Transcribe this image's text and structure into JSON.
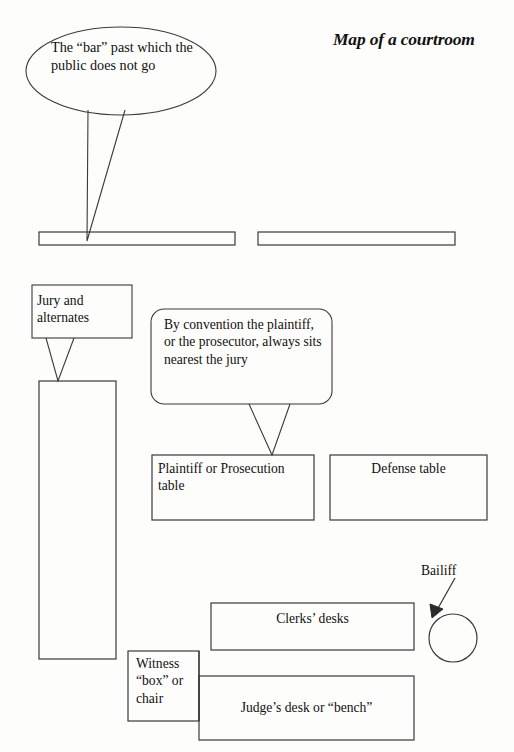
{
  "page": {
    "title": "Map of a courtroom",
    "width": 514,
    "height": 752,
    "background_color": "#fdfdfc",
    "stroke_color": "#3a3a3a",
    "text_color": "#111111"
  },
  "callouts": {
    "bar": {
      "text": "The “bar”  past which the public does not go",
      "shape": "ellipse"
    },
    "jury": {
      "text": "Jury and alternates",
      "shape": "rectangle"
    },
    "plaintiff": {
      "text": "By convention the plaintiff, or the prosecutor, always sits nearest the jury",
      "shape": "rounded-rectangle"
    }
  },
  "labels": {
    "bailiff": "Bailiff"
  },
  "rooms": {
    "gallery_bench_left": "",
    "gallery_bench_right": "",
    "jury_box": "",
    "plaintiff_table": "Plaintiff or Prosecution table",
    "defense_table": "Defense table",
    "clerks_desks": "Clerks’ desks",
    "witness_box": "Witness “box” or chair",
    "judge_desk": "Judge’s desk or “bench”"
  }
}
